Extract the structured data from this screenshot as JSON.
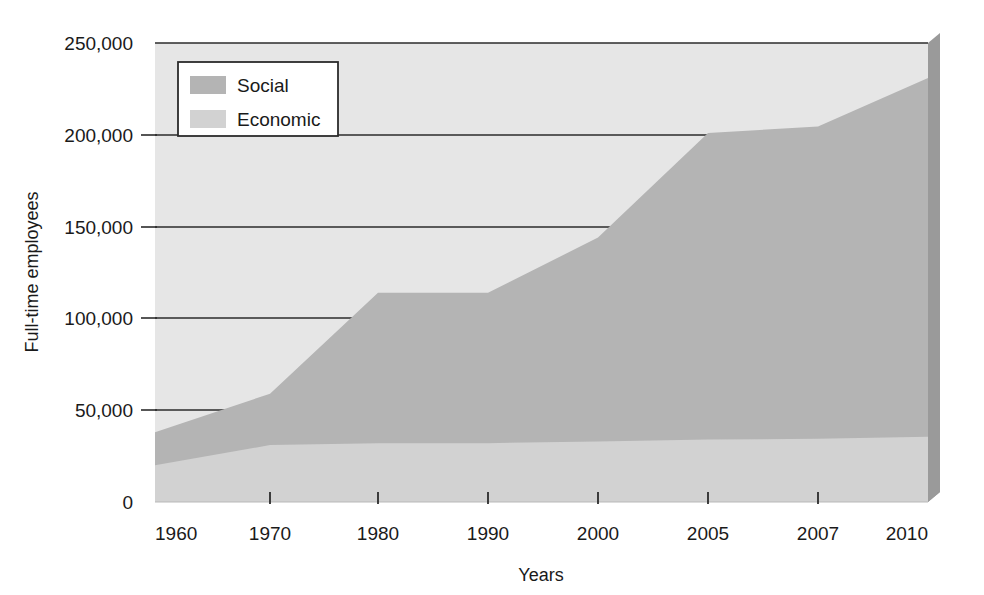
{
  "chart_data": {
    "type": "area",
    "stacked": true,
    "title": "",
    "xlabel": "Years",
    "ylabel": "Full-time employees",
    "categories": [
      "1960",
      "1970",
      "1980",
      "1990",
      "2000",
      "2005",
      "2007",
      "2010"
    ],
    "x_tick_labels": [
      "1960",
      "1970",
      "1980",
      "1990",
      "2000",
      "2005",
      "2007",
      "2010"
    ],
    "y_tick_labels": [
      "0",
      "50,000",
      "100,000",
      "150,000",
      "200,000",
      "250,000"
    ],
    "y_tick_values": [
      0,
      50000,
      100000,
      150000,
      200000,
      250000
    ],
    "ylim": [
      0,
      250000
    ],
    "grid": "horizontal",
    "legend_position": "top-left-inside",
    "series": [
      {
        "name": "Economic",
        "color": "#d2d2d2",
        "values": [
          20000,
          31000,
          32000,
          32000,
          33000,
          34000,
          34500,
          35500
        ]
      },
      {
        "name": "Social",
        "color": "#b4b4b4",
        "values": [
          18000,
          28000,
          82000,
          82000,
          111000,
          167000,
          170000,
          195500
        ]
      }
    ],
    "totals": [
      38000,
      59000,
      114000,
      114000,
      144000,
      201000,
      204500,
      231000
    ],
    "annotations": []
  },
  "legend": {
    "entries": [
      {
        "label": "Social",
        "swatch_color": "#b4b4b4"
      },
      {
        "label": "Economic",
        "swatch_color": "#d2d2d2"
      }
    ]
  },
  "axes": {
    "y_title": "Full-time employees",
    "x_title": "Years"
  },
  "colors": {
    "plot_background": "#e6e6e6",
    "social": "#b4b4b4",
    "economic": "#d2d2d2",
    "gridline": "#2b2b2b",
    "shadow": "#9a9a9a",
    "text": "#1a1a1a"
  }
}
